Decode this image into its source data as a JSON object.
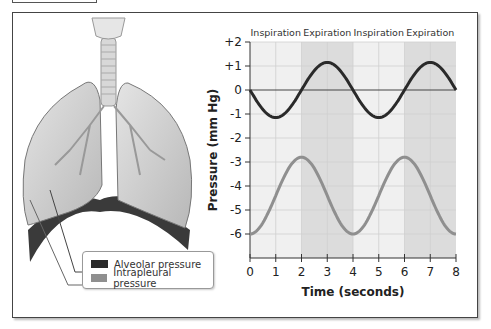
{
  "figure": {
    "legend": {
      "items": [
        {
          "label": "Alveolar pressure",
          "color": "#2a2a2a"
        },
        {
          "label": "Intrapleural pressure",
          "color": "#8f8f8f"
        }
      ]
    },
    "illustration": "lungs-with-trachea"
  },
  "chart_data": {
    "type": "line",
    "title": "",
    "xlabel": "Time (seconds)",
    "ylabel": "Pressure (mm Hg)",
    "x_ticks": [
      "0",
      "1",
      "2",
      "3",
      "4",
      "5",
      "6",
      "7",
      "8"
    ],
    "y_ticks": [
      "+2",
      "+1",
      "0",
      "-1",
      "-2",
      "-3",
      "-4",
      "-5",
      "-6"
    ],
    "xlim": [
      0,
      8
    ],
    "ylim": [
      -6.5,
      2
    ],
    "grid": true,
    "phase_labels": [
      "Inspiration",
      "Expiration",
      "Inspiration",
      "Expiration"
    ],
    "phase_bands": [
      {
        "label": "Inspiration",
        "start": 0,
        "end": 2,
        "shade": "light"
      },
      {
        "label": "Expiration",
        "start": 2,
        "end": 4,
        "shade": "dark"
      },
      {
        "label": "Inspiration",
        "start": 4,
        "end": 6,
        "shade": "light"
      },
      {
        "label": "Expiration",
        "start": 6,
        "end": 8,
        "shade": "dark"
      }
    ],
    "x": [
      0,
      0.5,
      1,
      1.5,
      2,
      2.5,
      3,
      3.5,
      4,
      4.5,
      5,
      5.5,
      6,
      6.5,
      7,
      7.5,
      8
    ],
    "series": [
      {
        "name": "Alveolar pressure",
        "color": "#2a2a2a",
        "values": [
          0,
          -0.8,
          -1.15,
          -0.8,
          0,
          0.85,
          1.2,
          0.85,
          0,
          -0.8,
          -1.15,
          -0.8,
          0,
          0.85,
          1.2,
          0.85,
          0
        ]
      },
      {
        "name": "Intrapleural pressure",
        "color": "#8f8f8f",
        "values": [
          -2.8,
          -3.3,
          -4.4,
          -5.5,
          -6.0,
          -5.5,
          -4.4,
          -3.3,
          -2.8,
          -3.3,
          -4.4,
          -5.5,
          -6.0,
          -5.5,
          -4.4,
          -3.3,
          -2.8
        ]
      }
    ],
    "legend_position": "bottom-left"
  }
}
